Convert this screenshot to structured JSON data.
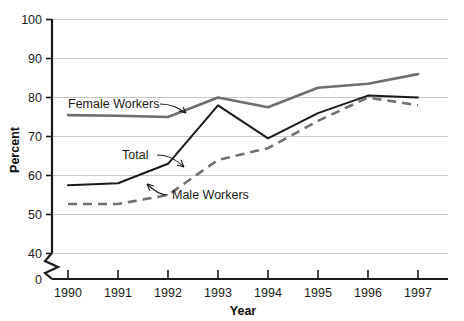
{
  "chart_data": {
    "type": "line",
    "title": "",
    "xlabel": "Year",
    "ylabel": "Percent",
    "categories": [
      "1990",
      "1991",
      "1992",
      "1993",
      "1994",
      "1995",
      "1996",
      "1997"
    ],
    "x": [
      1990,
      1991,
      1992,
      1993,
      1994,
      1995,
      1996,
      1997
    ],
    "xlim": [
      1990,
      1997
    ],
    "ylim": [
      40,
      100
    ],
    "y_broken_axis": true,
    "y_break_from": 0,
    "y_break_to": 40,
    "yticks": [
      "0",
      "40",
      "50",
      "60",
      "70",
      "80",
      "90",
      "100"
    ],
    "ytick_values": [
      0,
      40,
      50,
      60,
      70,
      80,
      90,
      100
    ],
    "grid": "horizontal",
    "legend_position": "inline-annotations",
    "series": [
      {
        "name": "Female Workers",
        "style": "solid",
        "color": "#6e6e6e",
        "width": 2.6,
        "values": [
          75.5,
          75.3,
          75.0,
          80.0,
          77.5,
          82.5,
          83.5,
          86.0
        ]
      },
      {
        "name": "Total",
        "style": "solid",
        "color": "#1a1a1a",
        "width": 2.0,
        "values": [
          57.5,
          58.0,
          63.0,
          78.0,
          69.5,
          76.0,
          80.5,
          80.0
        ]
      },
      {
        "name": "Male Workers",
        "style": "dashed",
        "color": "#707070",
        "width": 2.6,
        "values": [
          52.7,
          52.7,
          55.0,
          64.0,
          67.0,
          74.0,
          80.0,
          78.0
        ]
      }
    ],
    "annotations": [
      {
        "text": "Female Workers",
        "target_series": "Female Workers"
      },
      {
        "text": "Total",
        "target_series": "Total"
      },
      {
        "text": "Male Workers",
        "target_series": "Male Workers"
      }
    ]
  },
  "colors": {
    "grid": "#c9c9c9",
    "axis": "#1a1a1a",
    "text": "#1a1a1a",
    "background": "#ffffff"
  }
}
